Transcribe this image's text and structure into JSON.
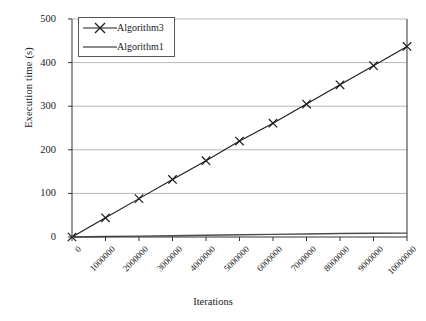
{
  "chart_data": {
    "type": "line",
    "title": "",
    "xlabel": "Iterations",
    "ylabel": "Execution time (s)",
    "xlim": [
      0,
      10000000
    ],
    "ylim": [
      0,
      500
    ],
    "grid": true,
    "legend_position": "top-left",
    "x": [
      0,
      1000000,
      2000000,
      3000000,
      4000000,
      5000000,
      6000000,
      7000000,
      8000000,
      9000000,
      10000000
    ],
    "xtick_labels": [
      "0",
      "1000000",
      "2000000",
      "3000000",
      "4000000",
      "5000000",
      "6000000",
      "7000000",
      "8000000",
      "9000000",
      "10000000"
    ],
    "ytick_labels": [
      "0",
      "100",
      "200",
      "300",
      "400",
      "500"
    ],
    "ytick_values": [
      0,
      100,
      200,
      300,
      400,
      500
    ],
    "series": [
      {
        "name": "Algorithm3",
        "marker": "x",
        "color": "#1a1a1a",
        "values": [
          0,
          44,
          88,
          132,
          175,
          220,
          261,
          305,
          349,
          393,
          437
        ]
      },
      {
        "name": "Algorithm1",
        "marker": "none",
        "color": "#4d4d4d",
        "values": [
          0,
          1,
          2,
          3,
          4,
          5,
          6,
          7,
          8,
          8.5,
          9
        ]
      }
    ]
  },
  "legend": {
    "items": [
      {
        "label": "Algorithm3"
      },
      {
        "label": "Algorithm1"
      }
    ]
  },
  "axes": {
    "y_title": "Execution time (s)",
    "x_title": "Iterations"
  }
}
